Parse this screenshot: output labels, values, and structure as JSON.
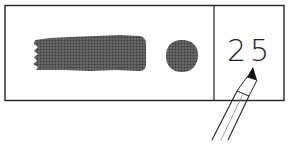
{
  "illustration": {
    "description": "Color swatch test box with smeared bar, dot, and handwritten value",
    "swatch_color": "#555555",
    "line_color": "#222222",
    "background": "#ffffff",
    "handwritten_value": "25",
    "elements": {
      "outer_box": "outlined rectangle",
      "divider": "vertical line",
      "smear_bar": "halftone brush stroke",
      "dot": "halftone circle",
      "pencil": "pencil pointing at value"
    }
  }
}
